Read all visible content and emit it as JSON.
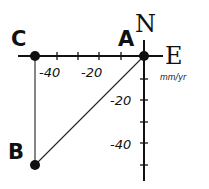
{
  "diagram": {
    "type": "velocity-vector-triangle",
    "axes": {
      "horizontal_label": "E",
      "vertical_label": "N",
      "units": "mm/yr",
      "x_tick_labels": [
        "-40",
        "-20"
      ],
      "y_tick_labels": [
        "-20",
        "-40"
      ]
    },
    "points": [
      {
        "id": "A",
        "label": "A",
        "e": 0,
        "n": 0
      },
      {
        "id": "B",
        "label": "B",
        "e": -50,
        "n": -50
      },
      {
        "id": "C",
        "label": "C",
        "e": -50,
        "n": 0
      }
    ],
    "segments": [
      {
        "from": "A",
        "to": "C"
      },
      {
        "from": "C",
        "to": "B"
      },
      {
        "from": "B",
        "to": "A"
      }
    ],
    "colors": {
      "ink": "#111111",
      "background": "#ffffff"
    }
  }
}
